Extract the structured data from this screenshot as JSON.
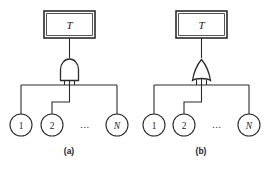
{
  "figure": {
    "background_color": "#ffffff",
    "line_color": "#2b2b2b",
    "width": 273,
    "height": 171,
    "panels": [
      {
        "id": "panel-a",
        "caption": "(a)",
        "gate": {
          "type": "and-gate",
          "symbol_name": "logic-and-gate"
        },
        "top_event": {
          "label": "T",
          "shape": "rectangle"
        },
        "basic_events": [
          {
            "label": "1",
            "style": "upright"
          },
          {
            "label": "2",
            "style": "upright"
          },
          {
            "label": "...",
            "style": "ellipsis"
          },
          {
            "label": "N",
            "style": "italic"
          }
        ]
      },
      {
        "id": "panel-b",
        "caption": "(b)",
        "gate": {
          "type": "or-gate",
          "symbol_name": "logic-or-gate"
        },
        "top_event": {
          "label": "T",
          "shape": "rectangle"
        },
        "basic_events": [
          {
            "label": "1",
            "style": "upright"
          },
          {
            "label": "2",
            "style": "upright"
          },
          {
            "label": "...",
            "style": "ellipsis"
          },
          {
            "label": "N",
            "style": "italic"
          }
        ]
      }
    ]
  }
}
